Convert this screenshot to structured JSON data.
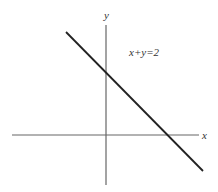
{
  "diagram": {
    "type": "coordinate-plane-line",
    "equation_label": "x+y=2",
    "axes": {
      "x_label": "x",
      "y_label": "y",
      "origin_px": [
        106,
        135
      ],
      "x_axis_px": {
        "x1": 12,
        "x2": 199,
        "y": 135
      },
      "y_axis_px": {
        "x": 106,
        "y1": 25,
        "y2": 185
      }
    },
    "line": {
      "from_px": [
        66,
        32
      ],
      "to_px": [
        203,
        171
      ],
      "y_intercept_px": [
        106,
        72
      ],
      "x_intercept_px": [
        168,
        135
      ]
    },
    "colors": {
      "background": "#ffffff",
      "axis": "#666666",
      "line": "#222222",
      "text": "#333333"
    }
  }
}
